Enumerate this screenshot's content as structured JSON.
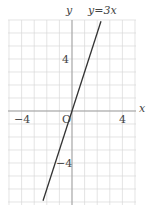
{
  "chart_data": {
    "type": "line",
    "title": "",
    "equation_label": "y=3x",
    "xlabel": "x",
    "ylabel": "y",
    "origin_label": "O",
    "xlim": [
      -5,
      5
    ],
    "ylim": [
      -7,
      7
    ],
    "grid": true,
    "x_ticks": [
      {
        "value": -4,
        "label": "−4"
      },
      {
        "value": 4,
        "label": "4"
      }
    ],
    "y_ticks": [
      {
        "value": 4,
        "label": "4"
      },
      {
        "value": -4,
        "label": "−4"
      }
    ],
    "series": [
      {
        "name": "y=3x",
        "slope": 3,
        "intercept": 0,
        "x": [
          -2.3,
          2.3
        ],
        "y": [
          -6.9,
          6.9
        ]
      }
    ]
  },
  "colors": {
    "grid": "#d9d9d9",
    "axis": "#999999",
    "line": "#333333",
    "text": "#444444"
  }
}
